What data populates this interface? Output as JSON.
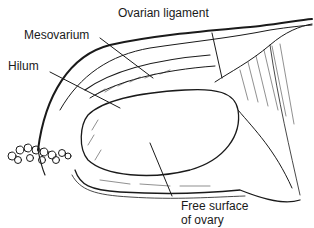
{
  "diagram": {
    "labels": {
      "ovarian_ligament": "Ovarian ligament",
      "mesovarium": "Mesovarium",
      "hilum": "Hilum",
      "free_surface_line1": "Free surface",
      "free_surface_line2": "of ovary"
    },
    "colors": {
      "ink": "#1a1a1a",
      "background": "#ffffff"
    }
  }
}
